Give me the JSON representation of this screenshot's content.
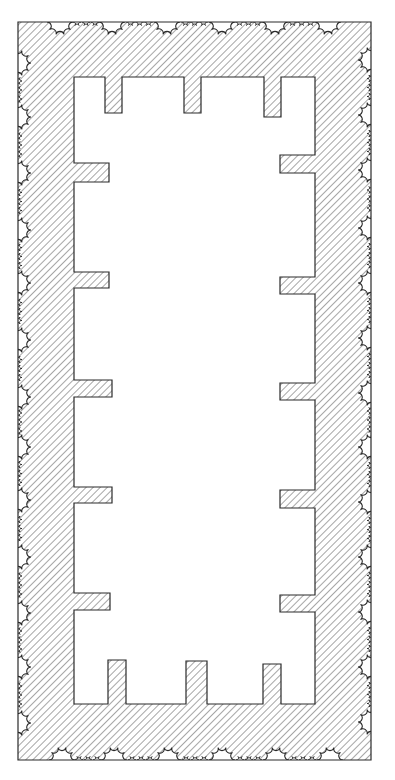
{
  "diagram": {
    "title": "Temple floor plan (peripteral colonnade, hatched walls)",
    "type": "architectural-plan",
    "canvas": {
      "width": 395,
      "height": 780
    },
    "colors": {
      "background": "#ffffff",
      "stroke": "#2a2a2a",
      "hatch": "#3a3a3a"
    },
    "hatch": {
      "angle_deg": 45,
      "spacing": 5,
      "stroke_width": 0.9
    },
    "outer_wall": {
      "x1": 18,
      "y1": 22,
      "x2": 371,
      "y2": 760
    },
    "inner_room": {
      "left": 74,
      "right": 315,
      "top": 77,
      "bottom": 704
    },
    "top_piers": [
      {
        "x": 105,
        "w": 17,
        "depth": 36
      },
      {
        "x": 184,
        "w": 17,
        "depth": 36
      },
      {
        "x": 264,
        "w": 17,
        "depth": 40
      }
    ],
    "bottom_piers": [
      {
        "x": 108,
        "w": 18,
        "depth": 44
      },
      {
        "x": 186,
        "w": 21,
        "depth": 43
      },
      {
        "x": 263,
        "w": 18,
        "depth": 40
      }
    ],
    "left_piers": [
      {
        "y": 163,
        "h": 19,
        "depth": 35
      },
      {
        "y": 272,
        "h": 16,
        "depth": 35
      },
      {
        "y": 380,
        "h": 17,
        "depth": 38
      },
      {
        "y": 487,
        "h": 16,
        "depth": 38
      },
      {
        "y": 593,
        "h": 17,
        "depth": 36
      }
    ],
    "right_piers": [
      {
        "y": 155,
        "h": 18,
        "depth": 35
      },
      {
        "y": 277,
        "h": 17,
        "depth": 35
      },
      {
        "y": 383,
        "h": 17,
        "depth": 35
      },
      {
        "y": 490,
        "h": 18,
        "depth": 35
      },
      {
        "y": 595,
        "h": 17,
        "depth": 35
      }
    ],
    "columns": {
      "radius": 13,
      "flutes": 10,
      "top_x": [
        60,
        112,
        167,
        222,
        275,
        328
      ],
      "bottom_x": [
        62,
        114,
        168,
        222,
        276,
        330
      ],
      "left_y": [
        63,
        117,
        173,
        230,
        283,
        340,
        397,
        447,
        500,
        557,
        613,
        667,
        723
      ],
      "right_y": [
        60,
        115,
        170,
        228,
        283,
        338,
        393,
        447,
        502,
        557,
        612,
        667,
        722
      ]
    }
  }
}
